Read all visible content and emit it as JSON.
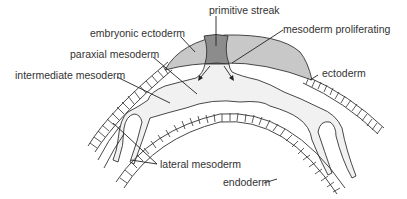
{
  "diagram": {
    "type": "embryo cross-section",
    "colors": {
      "embryonic_ectoderm_fill": "#c8c8c8",
      "primitive_streak_fill": "#8c8c8c",
      "mesoderm_fill": "#f0f0f0",
      "line": "#333333",
      "text": "#333333",
      "background": "#ffffff"
    },
    "labels": {
      "primitive_streak": "primitive streak",
      "embryonic_ectoderm": "embryonic ectoderm",
      "mesoderm_proliferating": "mesoderm proliferating",
      "paraxial_mesoderm": "paraxial mesoderm",
      "intermediate_mesoderm": "intermediate mesoderm",
      "ectoderm": "ectoderm",
      "lateral_mesoderm": "lateral mesoderm",
      "endoderm": "endoderm"
    }
  }
}
